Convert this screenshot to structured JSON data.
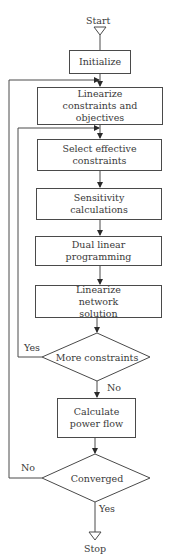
{
  "flowchart": {
    "start_label": "Start",
    "stop_label": "Stop",
    "steps": {
      "initialize": "Initialize",
      "linearize_constraints": "Linearize constraints and objectives",
      "select_effective": "Select effective constraints",
      "sensitivity": "Sensitivity calculations",
      "dual_lp": "Dual linear programming",
      "linearize_network": "Linearize network solution",
      "calc_power_flow": "Calculate power flow"
    },
    "decisions": {
      "more_constraints": "More constraints",
      "converged": "Converged"
    },
    "branch_labels": {
      "more_constraints_yes": "Yes",
      "more_constraints_no": "No",
      "converged_no": "No",
      "converged_yes": "Yes"
    },
    "colors": {
      "line": "#4a4a4a",
      "text": "#3a3a3a",
      "background": "#ffffff"
    }
  }
}
